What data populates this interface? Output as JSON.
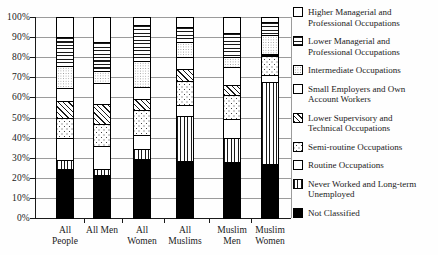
{
  "chart_data": {
    "type": "bar",
    "stacked": true,
    "orientation": "vertical",
    "title": "",
    "xlabel": "",
    "ylabel": "",
    "ylim": [
      0,
      100
    ],
    "grid": true,
    "yticks": [
      0,
      10,
      20,
      30,
      40,
      50,
      60,
      70,
      80,
      90,
      100
    ],
    "ytick_suffix": "%",
    "categories": [
      "All People",
      "All Men",
      "All Women",
      "All Muslims",
      "Muslim Men",
      "Muslim Women"
    ],
    "category_label_lines": [
      [
        "All",
        "People"
      ],
      [
        "All Men"
      ],
      [
        "All",
        "Women"
      ],
      [
        "All",
        "Muslims"
      ],
      [
        "Muslim",
        "Men"
      ],
      [
        "Muslim",
        "Women"
      ]
    ],
    "series_note": "series listed bottom-to-top of stack; values are percent of total",
    "series": [
      {
        "name": "Not Classified",
        "pattern": "solid-black",
        "values": [
          24.7,
          21.7,
          29.7,
          28.5,
          28.0,
          27.2
        ]
      },
      {
        "name": "Never Worked and Long-term Unemployed",
        "pattern": "vertical-lines",
        "values": [
          4.5,
          3.0,
          5.0,
          22.7,
          12.0,
          41.0
        ]
      },
      {
        "name": "Routine Occupations",
        "pattern": "white",
        "values": [
          10.6,
          11.1,
          6.6,
          5.2,
          9.6,
          3.4
        ]
      },
      {
        "name": "Semi-routine Occupations",
        "pattern": "diagonal-dots",
        "values": [
          10.1,
          11.1,
          12.6,
          11.9,
          12.1,
          9.4
        ]
      },
      {
        "name": "Lower Supervisory and Technical Occupations",
        "pattern": "diagonal-hatch",
        "values": [
          8.6,
          10.0,
          5.8,
          6.2,
          4.6,
          0.5
        ]
      },
      {
        "name": "Small Employers and Own Account Workers",
        "pattern": "white",
        "values": [
          6.7,
          10.8,
          5.6,
          6.2,
          9.1,
          0.5
        ]
      },
      {
        "name": "Intermediate Occupations",
        "pattern": "fine-dots",
        "values": [
          10.8,
          5.8,
          13.0,
          7.5,
          5.0,
          9.5
        ]
      },
      {
        "name": "Lower Managerial and Professional Occupations",
        "pattern": "horizontal-lines",
        "values": [
          14.5,
          14.4,
          18.2,
          7.5,
          12.0,
          6.3
        ]
      },
      {
        "name": "Higher Managerial and Professional Occupations",
        "pattern": "white",
        "values": [
          9.5,
          12.1,
          3.5,
          4.3,
          7.6,
          2.2
        ]
      }
    ],
    "legend_position": "right",
    "legend": [
      {
        "label": "Higher Managerial and Professional Occupations",
        "lines": [
          "Higher Managerial and",
          "Professional Occupations"
        ],
        "pattern": "white"
      },
      {
        "label": "Lower Managerial and Professional Occupations",
        "lines": [
          "Lower Managerial and",
          "Professional Occupations"
        ],
        "pattern": "horizontal-lines"
      },
      {
        "label": "Intermediate Occupations",
        "lines": [
          "Intermediate Occupations"
        ],
        "pattern": "fine-dots"
      },
      {
        "label": "Small Employers and Own Account Workers",
        "lines": [
          "Small Employers and Own",
          "Account Workers"
        ],
        "pattern": "white"
      },
      {
        "label": "Lower Supervisory and Technical Occupations",
        "lines": [
          "Lower Supervisory and",
          "Technical Occupations"
        ],
        "pattern": "diagonal-hatch"
      },
      {
        "label": "Semi-routine Occupations",
        "lines": [
          "Semi-routine Occupations"
        ],
        "pattern": "diagonal-dots"
      },
      {
        "label": "Routine Occupations",
        "lines": [
          "Routine Occupations"
        ],
        "pattern": "white"
      },
      {
        "label": "Never Worked and Long-term Unemployed",
        "lines": [
          "Never Worked and Long-term",
          "Unemployed"
        ],
        "pattern": "vertical-lines"
      },
      {
        "label": "Not Classified",
        "lines": [
          "Not Classified"
        ],
        "pattern": "solid-black"
      }
    ],
    "colors": {
      "ink": "#1a1a1a",
      "grid": "#9b9b9b",
      "bar_outline": "#000000",
      "background": "#ffffff"
    }
  }
}
